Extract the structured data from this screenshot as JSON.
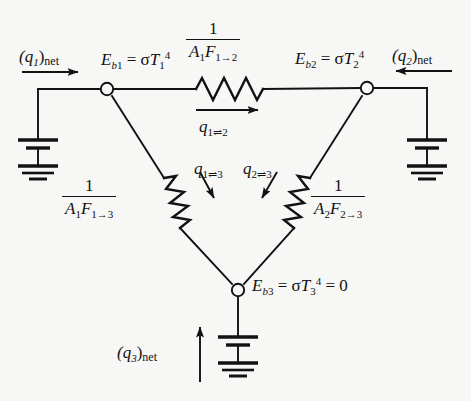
{
  "figure": {
    "name": "radiation-network-three-surface",
    "background_color": "#f7f7f6",
    "ink_color": "#121212"
  },
  "nodes": [
    {
      "id": "node-1",
      "label": "E_b1 = sigma T_1^4",
      "label_parts": {
        "E": "E",
        "sub": "b",
        "sub_index": "1",
        "eq": " = ",
        "sigma": "σ",
        "T": "T",
        "t_sub": "1",
        "t_sup": "4"
      },
      "x": 107,
      "y": 89
    },
    {
      "id": "node-2",
      "label": "E_b2 = sigma T_2^4",
      "label_parts": {
        "E": "E",
        "sub": "b",
        "sub_index": "2",
        "eq": " = ",
        "sigma": "σ",
        "T": "T",
        "t_sub": "2",
        "t_sup": "4"
      },
      "x": 367,
      "y": 88
    },
    {
      "id": "node-3",
      "label": "E_b3 = sigma T_3^4 = 0",
      "label_parts": {
        "E": "E",
        "sub": "b",
        "sub_index": "3",
        "eq": " = ",
        "sigma": "σ",
        "T": "T",
        "t_sub": "3",
        "t_sup": "4",
        "tail": " = 0"
      },
      "x": 238,
      "y": 290
    }
  ],
  "resistors": [
    {
      "id": "resistor-1-2",
      "numerator": "1",
      "denominator_A": "A",
      "denominator_A_sub": "1",
      "denominator_F": "F",
      "denominator_F_sub": "1→2",
      "flow_label_q": "q",
      "flow_label_sub": "1⇌2",
      "orientation": "horizontal",
      "flow_direction": "right"
    },
    {
      "id": "resistor-1-3",
      "numerator": "1",
      "denominator_A": "A",
      "denominator_A_sub": "1",
      "denominator_F": "F",
      "denominator_F_sub": "1→3",
      "flow_label_q": "q",
      "flow_label_sub": "1⇌3",
      "orientation": "diagonal-left",
      "flow_direction": "down-right"
    },
    {
      "id": "resistor-2-3",
      "numerator": "1",
      "denominator_A": "A",
      "denominator_A_sub": "2",
      "denominator_F": "F",
      "denominator_F_sub": "2→3",
      "flow_label_q": "q",
      "flow_label_sub": "2⇌3",
      "orientation": "diagonal-right",
      "flow_direction": "down-left"
    }
  ],
  "sources": [
    {
      "id": "source-1",
      "flow_label_q": "(q",
      "flow_label_sub": "1",
      "flow_label_tail": ")",
      "flow_label_net": "net",
      "arrow_direction": "right",
      "position": "left"
    },
    {
      "id": "source-2",
      "flow_label_q": "(q",
      "flow_label_sub": "2",
      "flow_label_tail": ")",
      "flow_label_net": "net",
      "arrow_direction": "left",
      "position": "right"
    },
    {
      "id": "source-3",
      "flow_label_q": "(q",
      "flow_label_sub": "3",
      "flow_label_tail": ")",
      "flow_label_net": "net",
      "arrow_direction": "up",
      "position": "bottom"
    }
  ]
}
